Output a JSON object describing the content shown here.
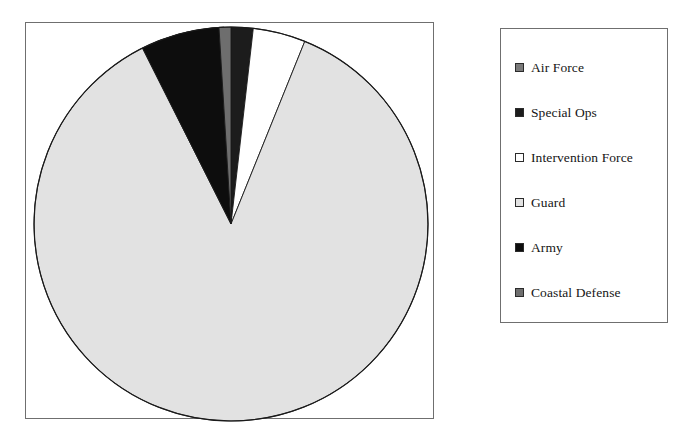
{
  "chart_data": {
    "type": "pie",
    "title": "",
    "subtitle": "",
    "xlabel": "",
    "ylabel": "",
    "legend_position": "right",
    "grid": false,
    "start_angle_deg": -26.7,
    "direction": "clockwise",
    "categories": [
      "Air Force",
      "Special Ops",
      "Intervention Force",
      "Guard",
      "Army",
      "Coastal Defense"
    ],
    "values": [
      1.0,
      1.8,
      4.3,
      86.4,
      6.5,
      1.0
    ],
    "units": "percent",
    "slices": [
      {
        "name": "air-force",
        "label": "Air Force",
        "value": 1.0,
        "color": "#7a7a7a",
        "start_deg": -3.5,
        "end_deg": -2.0
      },
      {
        "name": "special-ops",
        "label": "Special Ops",
        "value": 1.8,
        "color": "#1c1c1c",
        "start_deg": 0.0,
        "end_deg": 6.5
      },
      {
        "name": "intervention-force",
        "label": "Intervention Force",
        "value": 4.3,
        "color": "#ffffff",
        "start_deg": 6.5,
        "end_deg": 22.0
      },
      {
        "name": "guard",
        "label": "Guard",
        "value": 86.4,
        "color": "#e2e2e2",
        "start_deg": 22.0,
        "end_deg": 333.3
      },
      {
        "name": "army",
        "label": "Army",
        "value": 6.5,
        "color": "#0d0d0d",
        "start_deg": 333.3,
        "end_deg": 356.5
      },
      {
        "name": "coastal-defense",
        "label": "Coastal Defense",
        "value": 1.0,
        "color": "#6e6e6e",
        "start_deg": 356.5,
        "end_deg": 360.0
      }
    ],
    "geometry": {
      "center_x": 231,
      "center_y": 224,
      "radius": 197
    }
  },
  "plot": {
    "frame_color": "#6f6f6f",
    "background_color": "#ffffff",
    "outline_color": "#1a1a1a"
  },
  "legend": {
    "border_color": "#6f6f6f",
    "items": [
      {
        "label": "Air Force",
        "color": "#7a7a7a",
        "swatch": "legend-swatch-air-force"
      },
      {
        "label": "Special Ops",
        "color": "#1c1c1c",
        "swatch": "legend-swatch-special-ops"
      },
      {
        "label": "Intervention Force",
        "color": "#ffffff",
        "swatch": "legend-swatch-intervention-force"
      },
      {
        "label": "Guard",
        "color": "#e2e2e2",
        "swatch": "legend-swatch-guard"
      },
      {
        "label": "Army",
        "color": "#0d0d0d",
        "swatch": "legend-swatch-army"
      },
      {
        "label": "Coastal Defense",
        "color": "#6e6e6e",
        "swatch": "legend-swatch-coastal-defense"
      }
    ]
  }
}
